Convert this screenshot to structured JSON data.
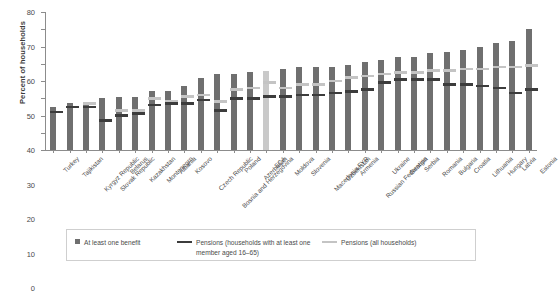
{
  "axis": {
    "ylabel": "Percent of households",
    "yticks": [
      0,
      10,
      20,
      30,
      40,
      50,
      60,
      70,
      80
    ]
  },
  "legend": {
    "items": [
      {
        "label": "At least one benefit",
        "marker": "square",
        "color": "#6f6f6f"
      },
      {
        "label": "Pensions (households with at least one member aged 16–65)",
        "marker": "line",
        "color": "#3c3c3c"
      },
      {
        "label": "Pensions (all households)",
        "marker": "line",
        "color": "#c4c4c4"
      }
    ]
  },
  "chart_data": {
    "type": "bar",
    "title": "",
    "xlabel": "",
    "ylabel": "Percent of households",
    "ylim": [
      0,
      80
    ],
    "grid": false,
    "legend_position": "bottom",
    "highlight_category": "ECA",
    "categories": [
      "Turkey",
      "Tajikistan",
      "Kyrgyz Republic",
      "Slovak Republic",
      "Belarus",
      "Kazakhstan",
      "Montenegro",
      "Albania",
      "Kosovo",
      "Czech Republic",
      "Bosnia and Herzegovina",
      "Poland",
      "Azerbaijan",
      "ECA",
      "Moldova",
      "Slovenia",
      "Macedonia FYR",
      "Uzbekistan",
      "Armenia",
      "Russian Federation",
      "Ukraine",
      "Georgia",
      "Serbia",
      "Romania",
      "Bulgaria",
      "Croatia",
      "Lithuania",
      "Hungary",
      "Latvia",
      "Estonia"
    ],
    "series": [
      {
        "name": "At least one benefit",
        "values": [
          25,
          27,
          27,
          30,
          31,
          31,
          34,
          34,
          37,
          42,
          44,
          44,
          45,
          46,
          47,
          48,
          48,
          48,
          49,
          51,
          52,
          54,
          54,
          56,
          57,
          58,
          60,
          62,
          63,
          70
        ]
      },
      {
        "name": "Pensions (households with at least one member aged 16–65)",
        "values": [
          22,
          25,
          25,
          17,
          20,
          21,
          26,
          27,
          27,
          29,
          23,
          30,
          30,
          31,
          31,
          32,
          32,
          33,
          34,
          35,
          39,
          41,
          41,
          41,
          38,
          38,
          37,
          36,
          33,
          35
        ]
      },
      {
        "name": "Pensions (all households)",
        "values": [
          null,
          null,
          27,
          null,
          23,
          23,
          30,
          28,
          31,
          32,
          28,
          35,
          36,
          39,
          36,
          38,
          38,
          40,
          42,
          43,
          44,
          45,
          45,
          46,
          46,
          47,
          47,
          48,
          48,
          49
        ]
      }
    ]
  }
}
